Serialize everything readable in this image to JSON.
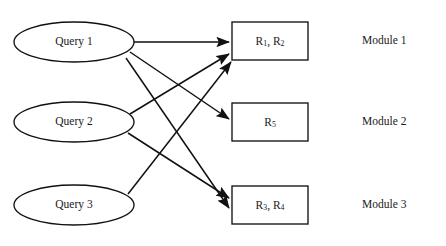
{
  "diagram": {
    "queries": [
      {
        "id": "query-1",
        "label": "Query 1",
        "cx": 74,
        "cy": 42,
        "rx": 60,
        "ry": 20
      },
      {
        "id": "query-2",
        "label": "Query 2",
        "cx": 74,
        "cy": 122,
        "rx": 60,
        "ry": 20
      },
      {
        "id": "query-3",
        "label": "Query 3",
        "cx": 74,
        "cy": 205,
        "rx": 60,
        "ry": 20
      }
    ],
    "results": [
      {
        "id": "result-box-1",
        "base_a": "R",
        "sub_a": "1",
        "sep": ", ",
        "base_b": "R",
        "sub_b": "2",
        "text": "R1, R2",
        "x": 232,
        "y": 22,
        "w": 76,
        "h": 38
      },
      {
        "id": "result-box-2",
        "base_a": "R",
        "sub_a": "5",
        "sep": "",
        "base_b": "",
        "sub_b": "",
        "text": "R5",
        "x": 232,
        "y": 103,
        "w": 76,
        "h": 38
      },
      {
        "id": "result-box-3",
        "base_a": "R",
        "sub_a": "3",
        "sep": ", ",
        "base_b": "R",
        "sub_b": "4",
        "text": "R3, R4",
        "x": 232,
        "y": 186,
        "w": 76,
        "h": 38
      }
    ],
    "modules": [
      {
        "id": "module-1",
        "label": "Module 1",
        "x": 362,
        "y": 34
      },
      {
        "id": "module-2",
        "label": "Module 2",
        "x": 362,
        "y": 115
      },
      {
        "id": "module-3",
        "label": "Module 3",
        "x": 362,
        "y": 198
      }
    ],
    "edges": [
      {
        "id": "edge-query1-box1",
        "from": "query-1",
        "to": "result-box-1",
        "x1": 134,
        "y1": 42,
        "x2": 229,
        "y2": 42
      },
      {
        "id": "edge-query1-box2",
        "from": "query-1",
        "to": "result-box-2",
        "x1": 130,
        "y1": 52,
        "x2": 229,
        "y2": 119
      },
      {
        "id": "edge-query1-box3",
        "from": "query-1",
        "to": "result-box-3",
        "x1": 126,
        "y1": 58,
        "x2": 229,
        "y2": 208
      },
      {
        "id": "edge-query2-box1",
        "from": "query-2",
        "to": "result-box-1",
        "x1": 130,
        "y1": 114,
        "x2": 229,
        "y2": 54
      },
      {
        "id": "edge-query2-box3",
        "from": "query-2",
        "to": "result-box-3",
        "x1": 128,
        "y1": 133,
        "x2": 229,
        "y2": 198
      },
      {
        "id": "edge-query3-box1",
        "from": "query-3",
        "to": "result-box-1",
        "x1": 128,
        "y1": 194,
        "x2": 231,
        "y2": 62
      }
    ],
    "colors": {
      "stroke": "#111111",
      "background": "#ffffff",
      "text": "#1a1a1a"
    }
  }
}
